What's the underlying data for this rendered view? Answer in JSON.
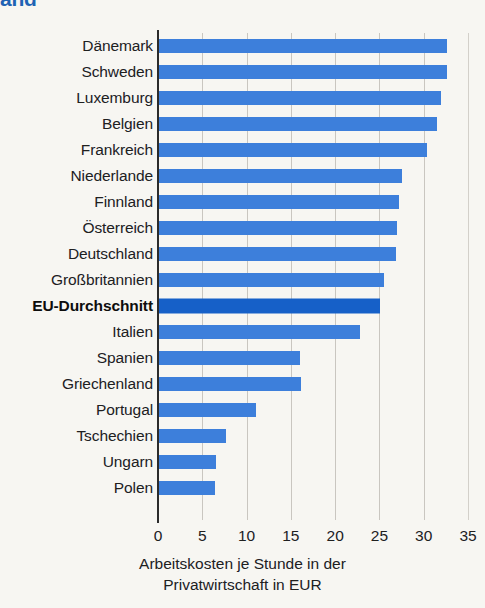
{
  "title": "and",
  "chart_data": {
    "type": "bar",
    "orientation": "horizontal",
    "title": "and",
    "xlabel_lines": [
      "Arbeitskosten je Stunde in der",
      "Privatwirtschaft in EUR"
    ],
    "ylabel": "",
    "xlim": [
      0,
      35
    ],
    "xticks": [
      0,
      5,
      10,
      15,
      20,
      25,
      30,
      35
    ],
    "xtick_labels": [
      "0",
      "5",
      "10",
      "15",
      "20",
      "25",
      "30",
      "35"
    ],
    "grid": true,
    "legend": "none",
    "unit": "EUR",
    "bar_color": "#3d7fdb",
    "highlight_color": "#1660c8",
    "categories": [
      "Dänemark",
      "Schweden",
      "Luxemburg",
      "Belgien",
      "Frankreich",
      "Niederlande",
      "Finnland",
      "Österreich",
      "Deutschland",
      "Großbritannien",
      "EU-Durchschnitt",
      "Italien",
      "Spanien",
      "Griechenland",
      "Portugal",
      "Tschechien",
      "Ungarn",
      "Polen"
    ],
    "values": [
      32.5,
      32.5,
      31.8,
      31.4,
      30.3,
      27.4,
      27.1,
      26.9,
      26.8,
      25.4,
      25.0,
      22.7,
      15.9,
      16.0,
      10.9,
      7.6,
      6.4,
      6.3
    ],
    "highlight_category": "EU-Durchschnitt"
  }
}
